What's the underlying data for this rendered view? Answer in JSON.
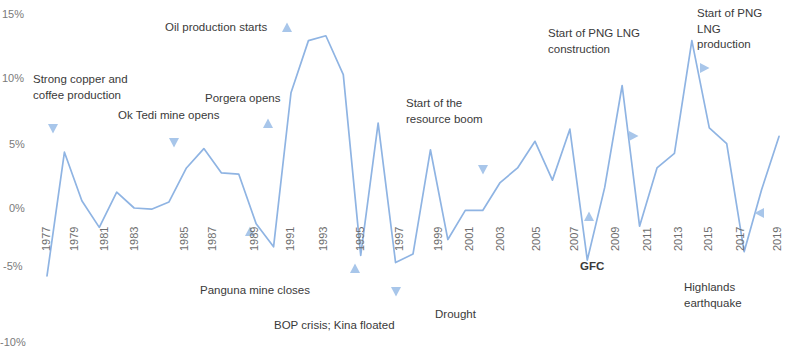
{
  "chart_data": {
    "type": "line",
    "title": "",
    "subtitle": "",
    "xlabel": "",
    "ylabel": "",
    "ylim": [
      -10,
      15
    ],
    "xlim": [
      1977,
      2019
    ],
    "grid": false,
    "legend": false,
    "line_color": "#8FB4E3",
    "marker_color": "#A8C6EA",
    "y_ticks": [
      "15%",
      "10%",
      "5%",
      "0%",
      "-5%",
      "-10%"
    ],
    "y_tick_values": [
      15,
      10,
      5,
      0,
      -5,
      -10
    ],
    "x_ticks": [
      "1977",
      "1979",
      "1981",
      "1983",
      "1985",
      "1987",
      "1989",
      "1991",
      "1993",
      "1995",
      "1997",
      "1999",
      "2001",
      "2003",
      "2005",
      "2007",
      "2009",
      "2011",
      "2013",
      "2015",
      "2017",
      "2019"
    ],
    "x": [
      1977,
      1978,
      1979,
      1980,
      1981,
      1982,
      1983,
      1984,
      1985,
      1986,
      1987,
      1988,
      1989,
      1990,
      1991,
      1992,
      1993,
      1994,
      1995,
      1996,
      1997,
      1998,
      1999,
      2000,
      2001,
      2002,
      2003,
      2004,
      2005,
      2006,
      2007,
      2008,
      2009,
      2010,
      2011,
      2012,
      2013,
      2014,
      2015,
      2016,
      2017,
      2018,
      2019
    ],
    "values": [
      -5.6,
      4.6,
      0.6,
      -1.6,
      1.3,
      0.0,
      -0.1,
      0.5,
      3.3,
      4.9,
      2.9,
      2.8,
      -1.3,
      -3.2,
      9.5,
      13.8,
      14.2,
      11.0,
      -3.9,
      7.0,
      -4.5,
      -3.8,
      4.8,
      -2.6,
      -0.2,
      -0.2,
      2.1,
      3.3,
      5.5,
      2.3,
      6.5,
      -4.3,
      1.7,
      10.1,
      -1.5,
      3.3,
      4.5,
      13.8,
      6.6,
      5.3,
      -3.6,
      1.5,
      5.9
    ],
    "annotations": [
      {
        "id": "strong-copper-coffee",
        "text": "Strong copper and\ncoffee production",
        "x": 33,
        "y": 72,
        "marker_x": 53,
        "marker_y": 129,
        "marker_dir": "down"
      },
      {
        "id": "ok-tedi",
        "text": "Ok Tedi mine opens",
        "x": 118,
        "y": 108,
        "marker_x": 174,
        "marker_y": 143,
        "marker_dir": "down"
      },
      {
        "id": "oil-production-starts",
        "text": "Oil production starts",
        "x": 165,
        "y": 20,
        "marker_x": 287,
        "marker_y": 27,
        "marker_dir": "up"
      },
      {
        "id": "porgera-opens",
        "text": "Porgera opens",
        "x": 205,
        "y": 91,
        "marker_x": 268,
        "marker_y": 123,
        "marker_dir": "up"
      },
      {
        "id": "panguna-mine-closes",
        "text": "Panguna mine closes",
        "x": 200,
        "y": 283,
        "marker_x": 250,
        "marker_y": 231,
        "marker_dir": "up"
      },
      {
        "id": "bop-crisis-kina-floated",
        "text": "BOP crisis; Kina floated",
        "x": 274,
        "y": 318,
        "marker_x": 355,
        "marker_y": 268,
        "marker_dir": "up"
      },
      {
        "id": "start-resource-boom",
        "text": "Start of the\nresource boom",
        "x": 406,
        "y": 96,
        "marker_x": 483,
        "marker_y": 170,
        "marker_dir": "down"
      },
      {
        "id": "drought",
        "text": "Drought",
        "x": 435,
        "y": 307,
        "marker_x": 396,
        "marker_y": 292,
        "marker_dir": "down"
      },
      {
        "id": "gfc",
        "text": "GFC",
        "x": 580,
        "y": 259,
        "marker_x": 589,
        "marker_y": 216,
        "marker_dir": "up"
      },
      {
        "id": "start-png-lng-construction",
        "text": "Start of PNG LNG\nconstruction",
        "x": 548,
        "y": 26,
        "marker_x": 634,
        "marker_y": 136,
        "marker_dir": "right"
      },
      {
        "id": "start-png-lng-production",
        "text": "Start of PNG LNG\nproduction",
        "x": 697,
        "y": 6,
        "marker_x": 705,
        "marker_y": 68,
        "marker_dir": "right"
      },
      {
        "id": "highlands-earthquake",
        "text": "Highlands\nearthquake",
        "x": 684,
        "y": 280,
        "marker_x": 759,
        "marker_y": 213,
        "marker_dir": "left"
      }
    ]
  },
  "axis": {
    "y_label_positions": [
      {
        "label": "15%",
        "top": 8,
        "left": 2
      },
      {
        "label": "10%",
        "top": 72,
        "left": 2
      },
      {
        "label": "5%",
        "top": 138,
        "left": 9
      },
      {
        "label": "0%",
        "top": 202,
        "left": 9
      },
      {
        "label": "-5%",
        "top": 260,
        "left": 3
      },
      {
        "label": "-10%",
        "top": 336,
        "left": 0
      }
    ],
    "x_label_positions": [
      {
        "label": "1977",
        "left": 40,
        "top": 213
      },
      {
        "label": "1979",
        "left": 68,
        "top": 213
      },
      {
        "label": "1981",
        "left": 98,
        "top": 213
      },
      {
        "label": "1983",
        "left": 128,
        "top": 213
      },
      {
        "label": "1985",
        "left": 178,
        "top": 213
      },
      {
        "label": "1987",
        "left": 206,
        "top": 213
      },
      {
        "label": "1989",
        "left": 248,
        "top": 213
      },
      {
        "label": "1991",
        "left": 284,
        "top": 213
      },
      {
        "label": "1993",
        "left": 317,
        "top": 213
      },
      {
        "label": "1995",
        "left": 354,
        "top": 213
      },
      {
        "label": "1997",
        "left": 393,
        "top": 213
      },
      {
        "label": "1999",
        "left": 432,
        "top": 213
      },
      {
        "label": "2001",
        "left": 463,
        "top": 213
      },
      {
        "label": "2003",
        "left": 494,
        "top": 213
      },
      {
        "label": "2005",
        "left": 530,
        "top": 213
      },
      {
        "label": "2007",
        "left": 568,
        "top": 213
      },
      {
        "label": "2009",
        "left": 609,
        "top": 213
      },
      {
        "label": "2011",
        "left": 641,
        "top": 213
      },
      {
        "label": "2013",
        "left": 672,
        "top": 213
      },
      {
        "label": "2015",
        "left": 702,
        "top": 213
      },
      {
        "label": "2017",
        "left": 734,
        "top": 213
      },
      {
        "label": "2019",
        "left": 771,
        "top": 213
      }
    ]
  }
}
